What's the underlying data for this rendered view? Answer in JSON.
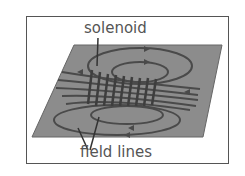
{
  "diagram": {
    "labels": {
      "solenoid": "solenoid",
      "field_lines": "field lines"
    },
    "colors": {
      "plane": "#8c8c8c",
      "lines": "#4a4a4a",
      "text": "#555555"
    }
  }
}
